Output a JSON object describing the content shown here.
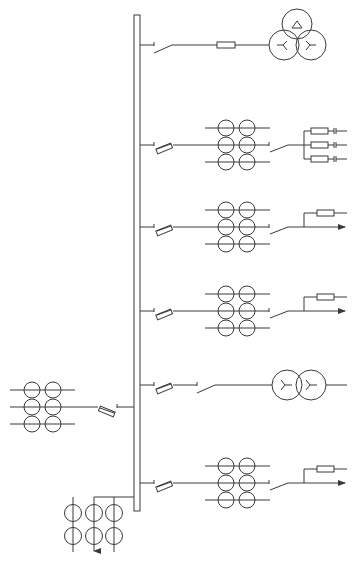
{
  "diagram": {
    "type": "electrical-single-line-diagram",
    "title": "",
    "colors": {
      "line": "#3a3a3a",
      "background": "#ffffff"
    },
    "busbar": {
      "orientation": "vertical",
      "x": 134,
      "width": 6,
      "y_top": 15,
      "y_bottom": 511
    },
    "feeders": [
      {
        "id": "feeder-1",
        "y": 45,
        "side": "right",
        "components": [
          "isolating-switch",
          "fuse",
          "three-winding-transformer"
        ]
      },
      {
        "id": "feeder-2",
        "y": 145,
        "side": "right",
        "components": [
          "fuse-cutout",
          "current-transformer-set",
          "switch",
          "three-fuse-capacitor-branch"
        ]
      },
      {
        "id": "feeder-3",
        "y": 227,
        "side": "right",
        "components": [
          "fuse-cutout",
          "current-transformer-set",
          "switch",
          "fuse-branch",
          "arrow-outgoing"
        ]
      },
      {
        "id": "feeder-4",
        "y": 311,
        "side": "right",
        "components": [
          "fuse-cutout",
          "current-transformer-set",
          "switch",
          "fuse-branch",
          "arrow-outgoing"
        ]
      },
      {
        "id": "feeder-5",
        "y": 385,
        "side": "right",
        "components": [
          "fuse-cutout",
          "switch",
          "two-winding-transformer"
        ]
      },
      {
        "id": "feeder-6",
        "y": 483,
        "side": "right",
        "components": [
          "fuse-cutout",
          "current-transformer-set",
          "switch",
          "fuse-branch",
          "arrow-outgoing"
        ]
      },
      {
        "id": "incoming-left",
        "y": 407,
        "side": "left",
        "components": [
          "current-transformer-set",
          "fuse-cutout"
        ]
      },
      {
        "id": "bottom-tap",
        "y": 497,
        "side": "left",
        "components": [
          "vertical-current-transformer-set",
          "arrow-downward"
        ]
      }
    ],
    "labels": []
  }
}
